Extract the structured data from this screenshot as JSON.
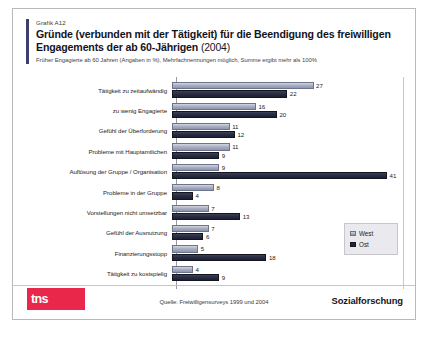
{
  "header": {
    "kicker": "Grafik A12",
    "title_main": "Gründe (verbunden mit der Tätigkeit) für die Beendigung des freiwilligen Engagements der ab 60-Jährigen",
    "title_year": "(2004)",
    "subtitle": "Früher Engagierte ab 60 Jahren (Angaben in %), Mehrfachnennungen möglich, Summe ergibt mehr als 100%"
  },
  "legend": {
    "items": [
      {
        "label": "West",
        "color": "#aab0c4",
        "swatch": "west"
      },
      {
        "label": "Ost",
        "color": "#23263a",
        "swatch": "ost"
      }
    ]
  },
  "footer": {
    "logo_tns": "tns",
    "logo_infratest": "infratest",
    "source": "Quelle: Freiwilligensurveys 1999 und 2004",
    "sozialforschung": "Sozialforschung"
  },
  "chart_data": {
    "type": "bar",
    "orientation": "horizontal",
    "title": "Gründe (verbunden mit der Tätigkeit) für die Beendigung des freiwilligen Engagements der ab 60-Jährigen (2004)",
    "subtitle": "Früher Engagierte ab 60 Jahren (Angaben in %), Mehrfachnennungen möglich, Summe ergibt mehr als 100%",
    "xlabel": "",
    "ylabel": "",
    "unit": "%",
    "xlim": [
      0,
      41
    ],
    "grid": false,
    "legend_position": "right",
    "categories": [
      "Tätigkeit zu zeitaufwändig",
      "zu wenig Engagierte",
      "Gefühl der Überforderung",
      "Probleme mit Hauptamtlichen",
      "Auflösung der Gruppe / Organisation",
      "Probleme in der Gruppe",
      "Vorstellungen nicht umsetzbar",
      "Gefühl der Ausnutzung",
      "Finanzierungsstopp",
      "Tätigkeit zu kostspielig"
    ],
    "series": [
      {
        "name": "West",
        "color": "#aab0c4",
        "values": [
          27,
          16,
          11,
          11,
          9,
          8,
          7,
          7,
          5,
          4
        ]
      },
      {
        "name": "Ost",
        "color": "#23263a",
        "values": [
          22,
          20,
          12,
          9,
          41,
          4,
          13,
          6,
          18,
          9
        ]
      }
    ],
    "source": "Quelle: Freiwilligensurveys 1999 und 2004"
  }
}
